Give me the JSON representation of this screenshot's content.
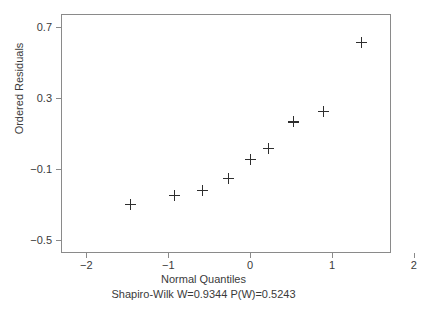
{
  "chart_data": {
    "type": "scatter",
    "title": "",
    "xlabel": "Normal Quantiles",
    "ylabel": "Ordered Residuals",
    "subtitle": "Shapiro-Wilk W=0.9344  P(W)=0.5243",
    "xlim": [
      -2.31,
      1.72
    ],
    "ylim": [
      -0.575,
      0.775
    ],
    "xticks": [
      -2,
      -1,
      0,
      1,
      2
    ],
    "xticklabels": [
      "−2",
      "−1",
      "0",
      "1",
      "2"
    ],
    "yticks": [
      0.7,
      0.3,
      -0.1,
      -0.5
    ],
    "yticklabels": [
      "0.7",
      "0.3",
      "−0.1",
      "−0.5"
    ],
    "grid": false,
    "legend": null,
    "marker": "plus",
    "marker_color": "#2e2e2e",
    "frame_color": "#8a8a8a",
    "x": [
      -1.46,
      -0.93,
      -0.58,
      -0.27,
      0.0,
      0.22,
      0.53,
      0.89,
      1.36
    ],
    "y": [
      -0.3,
      -0.25,
      -0.22,
      -0.155,
      -0.045,
      0.015,
      0.165,
      0.225,
      0.615
    ],
    "points": [
      {
        "x": -1.46,
        "y": -0.3
      },
      {
        "x": -0.93,
        "y": -0.25
      },
      {
        "x": -0.58,
        "y": -0.22
      },
      {
        "x": -0.27,
        "y": -0.155
      },
      {
        "x": 0.0,
        "y": -0.045
      },
      {
        "x": 0.22,
        "y": 0.015
      },
      {
        "x": 0.53,
        "y": 0.165
      },
      {
        "x": 0.89,
        "y": 0.225
      },
      {
        "x": 1.36,
        "y": 0.615
      }
    ],
    "statistics": {
      "test": "Shapiro-Wilk",
      "W_label": "W=0.9344",
      "W": 0.9344,
      "P_label": "P(W)=0.5243",
      "P": 0.5243
    }
  }
}
